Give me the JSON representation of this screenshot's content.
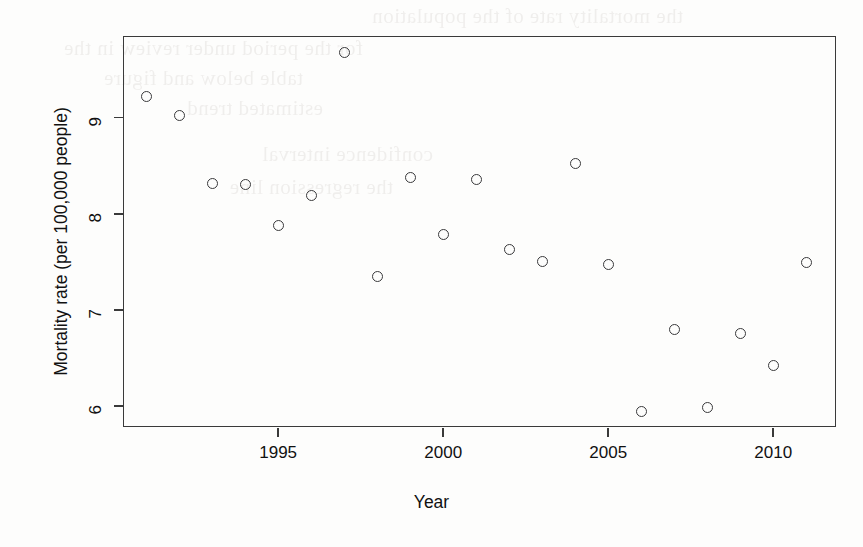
{
  "chart_data": {
    "type": "scatter",
    "title": "",
    "xlabel": "Year",
    "ylabel": "Mortality rate (per 100,000 people)",
    "xlim": [
      1990.3,
      2011.9
    ],
    "ylim": [
      5.78,
      9.85
    ],
    "xticks": [
      1995,
      2000,
      2005,
      2010
    ],
    "yticks": [
      6,
      7,
      8,
      9
    ],
    "xtick_labels": [
      "1995",
      "2000",
      "2005",
      "2010"
    ],
    "ytick_labels": [
      "6",
      "7",
      "8",
      "9"
    ],
    "grid": false,
    "legend": null,
    "marker": "open-circle",
    "marker_color": "#39393b",
    "x": [
      1991,
      1992,
      1993,
      1994,
      1995,
      1996,
      1997,
      1998,
      1999,
      2000,
      2001,
      2002,
      2003,
      2004,
      2005,
      2006,
      2007,
      2008,
      2009,
      2010,
      2011
    ],
    "y": [
      9.22,
      9.02,
      8.31,
      8.3,
      7.88,
      8.19,
      9.68,
      7.35,
      8.38,
      7.78,
      8.36,
      7.63,
      7.5,
      8.52,
      7.47,
      5.94,
      6.79,
      5.98,
      6.75,
      6.42,
      7.49
    ],
    "points": [
      {
        "year": 1991,
        "value": 9.22
      },
      {
        "year": 1992,
        "value": 9.02
      },
      {
        "year": 1993,
        "value": 8.31
      },
      {
        "year": 1994,
        "value": 8.3
      },
      {
        "year": 1995,
        "value": 7.88
      },
      {
        "year": 1996,
        "value": 8.19
      },
      {
        "year": 1997,
        "value": 9.68
      },
      {
        "year": 1998,
        "value": 7.35
      },
      {
        "year": 1999,
        "value": 8.38
      },
      {
        "year": 2000,
        "value": 7.78
      },
      {
        "year": 2001,
        "value": 8.36
      },
      {
        "year": 2002,
        "value": 7.63
      },
      {
        "year": 2003,
        "value": 7.5
      },
      {
        "year": 2004,
        "value": 8.52
      },
      {
        "year": 2005,
        "value": 7.47
      },
      {
        "year": 2006,
        "value": 5.94
      },
      {
        "year": 2007,
        "value": 6.79
      },
      {
        "year": 2008,
        "value": 5.98
      },
      {
        "year": 2009,
        "value": 6.75
      },
      {
        "year": 2010,
        "value": 6.42
      },
      {
        "year": 2011,
        "value": 7.49
      }
    ]
  },
  "axes": {
    "x_title": "Year",
    "y_title": "Mortality rate (per 100,000 people)"
  },
  "colors": {
    "axis": "#3a3a3a",
    "marker": "#39393b",
    "text": "#111111",
    "background": "#fdfdfc"
  },
  "background_bleed": {
    "note": "faint mirrored show-through text from reverse page of scan",
    "lines": [
      "the mortality rate of the population",
      "for the period under review in the",
      "table below and figure",
      "estimated trend",
      "confidence interval",
      "the regression line"
    ]
  }
}
